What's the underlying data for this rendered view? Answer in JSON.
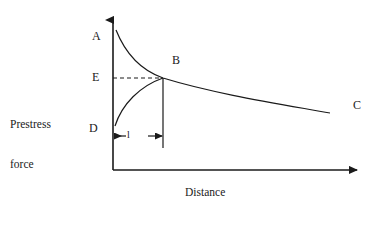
{
  "figure": {
    "title": "",
    "domain": "diagram",
    "background_color": "#ffffff",
    "stroke_color": "#1a1a1a"
  },
  "axes": {
    "y_axis": {
      "label": "Prestress\nforce",
      "label_line_1": "Prestress",
      "label_line_2": "force",
      "has_arrow_head": true,
      "origin_px": [
        113,
        170
      ],
      "tip_px": [
        113,
        16
      ]
    },
    "x_axis": {
      "label": "Distance",
      "has_arrow_head": true,
      "origin_px": [
        113,
        170
      ],
      "tip_px": [
        362,
        170
      ]
    }
  },
  "point_labels": [
    {
      "id": "A",
      "text": "A",
      "description": "top of descending prestress curve at the anchorage"
    },
    {
      "id": "E",
      "text": "E",
      "description": "prestress force level at point B on the vertical axis"
    },
    {
      "id": "D",
      "text": "D",
      "description": "bottom of ascending curve at the anchorage"
    },
    {
      "id": "B",
      "text": "B",
      "description": "intersection of descending and ascending curves"
    },
    {
      "id": "C",
      "text": "C",
      "description": "far end of the prestress force curve"
    }
  ],
  "dimension": {
    "label": "l",
    "description": "transmission / anchorage length between D and B",
    "arrow_left_px": [
      114,
      136
    ],
    "arrow_right_px": [
      163,
      136
    ]
  },
  "guides": {
    "dashed_line": {
      "from_px": [
        113,
        78
      ],
      "to_px": [
        163,
        78
      ],
      "style": "dashed",
      "description": "horizontal dashed line from E to B"
    },
    "vertical_drop": {
      "from_px": [
        163,
        78
      ],
      "to_px": [
        163,
        148
      ],
      "style": "solid",
      "description": "vertical line from B down past the dimension arrows"
    }
  },
  "curves": [
    {
      "id": "curve-A-B-C",
      "name": "descending prestress curve",
      "start_label": "A",
      "end_label": "C",
      "passes_through": "B",
      "path": "M 116 30 C 128 60, 146 72, 163 78 C 215 94, 280 104, 330 113"
    },
    {
      "id": "curve-D-B",
      "name": "ascending prestress curve",
      "start_label": "D",
      "end_label": "B",
      "path": "M 115 126 C 122 104, 140 86, 163 78"
    }
  ]
}
